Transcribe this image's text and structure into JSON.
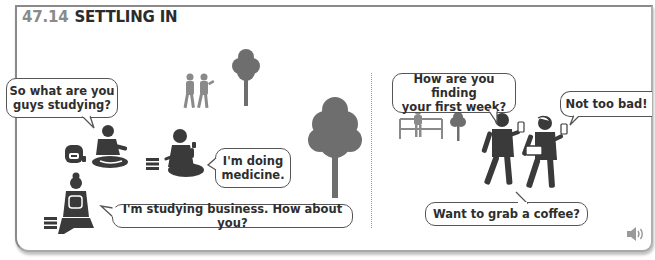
{
  "title": {
    "number": "47.14",
    "text": "SETTLING IN"
  },
  "colors": {
    "figure": "#3a3a3a",
    "tree": "#6e6e6e",
    "number": "#8a8a8a",
    "frame": "#8a8a8a"
  },
  "scene_left": {
    "bubbles": [
      {
        "id": "b1",
        "text_line1": "So what are you",
        "text_line2": "guys studying?"
      },
      {
        "id": "b2",
        "text_line1": "I'm doing",
        "text_line2": "medicine."
      },
      {
        "id": "b3",
        "text": "I'm studying business. How about you?"
      }
    ]
  },
  "scene_right": {
    "bubbles": [
      {
        "id": "b4",
        "text_line1": "How are you finding",
        "text_line2": "your first week?"
      },
      {
        "id": "b5",
        "text": "Not too bad!"
      },
      {
        "id": "b6",
        "text": "Want to grab a coffee?"
      }
    ]
  },
  "audio": {
    "icon": "speaker-icon"
  }
}
